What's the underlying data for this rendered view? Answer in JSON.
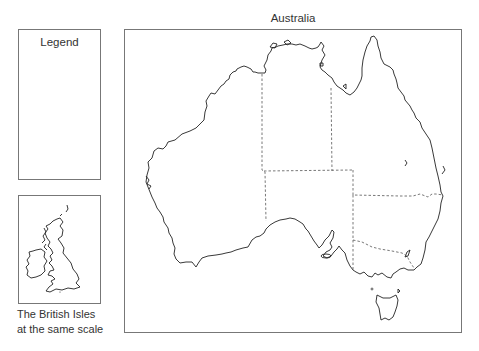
{
  "legend": {
    "title": "Legend"
  },
  "inset": {
    "caption_line1": "The British Isles",
    "caption_line2": "at the same scale",
    "region": "British Isles"
  },
  "map": {
    "title": "Australia",
    "regions": [
      "Western Australia",
      "Northern Territory",
      "Queensland",
      "South Australia",
      "New South Wales",
      "Victoria",
      "Tasmania"
    ],
    "colors": {
      "coastline": "#222222",
      "state_border": "#555555",
      "frame": "#777777"
    }
  }
}
